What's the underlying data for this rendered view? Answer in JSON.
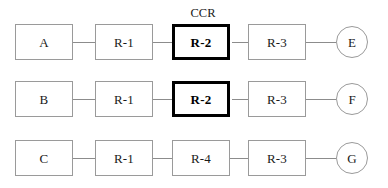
{
  "diagram": {
    "type": "process-flow",
    "title_annotation": {
      "label": "CCR",
      "x": 182,
      "y": 7,
      "width": 42,
      "describes": "row-1-stage-3"
    },
    "colors": {
      "background": "#ffffff",
      "node_border": "#9a9a9a",
      "highlight_border": "#000000",
      "connector": "#8c8c8c",
      "text": "#1a1a1a"
    },
    "geometry": {
      "box_width": 58,
      "box_height": 36,
      "circle_diameter": 32,
      "columns_x": [
        15,
        95,
        172,
        248
      ],
      "circle_x": 336,
      "rows_y": [
        24,
        81,
        140
      ]
    },
    "rows": [
      {
        "name": "row-1",
        "y": 24,
        "nodes": [
          {
            "id": "row-1-stage-1",
            "label": "A",
            "shape": "box",
            "x": 15,
            "highlight": false
          },
          {
            "id": "row-1-stage-2",
            "label": "R-1",
            "shape": "box",
            "x": 95,
            "highlight": false
          },
          {
            "id": "row-1-stage-3",
            "label": "R-2",
            "shape": "box",
            "x": 172,
            "highlight": true
          },
          {
            "id": "row-1-stage-4",
            "label": "R-3",
            "shape": "box",
            "x": 248,
            "highlight": false
          },
          {
            "id": "row-1-stage-5",
            "label": "E",
            "shape": "circle",
            "x": 336,
            "highlight": false
          }
        ],
        "connectors": [
          {
            "x": 73,
            "width": 22
          },
          {
            "x": 153,
            "width": 19
          },
          {
            "x": 232,
            "width": 16
          },
          {
            "x": 306,
            "width": 30
          }
        ]
      },
      {
        "name": "row-2",
        "y": 81,
        "nodes": [
          {
            "id": "row-2-stage-1",
            "label": "B",
            "shape": "box",
            "x": 15,
            "highlight": false
          },
          {
            "id": "row-2-stage-2",
            "label": "R-1",
            "shape": "box",
            "x": 95,
            "highlight": false
          },
          {
            "id": "row-2-stage-3",
            "label": "R-2",
            "shape": "box",
            "x": 172,
            "highlight": true
          },
          {
            "id": "row-2-stage-4",
            "label": "R-3",
            "shape": "box",
            "x": 248,
            "highlight": false
          },
          {
            "id": "row-2-stage-5",
            "label": "F",
            "shape": "circle",
            "x": 336,
            "highlight": false
          }
        ],
        "connectors": [
          {
            "x": 73,
            "width": 22
          },
          {
            "x": 153,
            "width": 19
          },
          {
            "x": 232,
            "width": 16
          },
          {
            "x": 306,
            "width": 30
          }
        ]
      },
      {
        "name": "row-3",
        "y": 140,
        "nodes": [
          {
            "id": "row-3-stage-1",
            "label": "C",
            "shape": "box",
            "x": 15,
            "highlight": false
          },
          {
            "id": "row-3-stage-2",
            "label": "R-1",
            "shape": "box",
            "x": 95,
            "highlight": false
          },
          {
            "id": "row-3-stage-3",
            "label": "R-4",
            "shape": "box",
            "x": 172,
            "highlight": false
          },
          {
            "id": "row-3-stage-4",
            "label": "R-3",
            "shape": "box",
            "x": 248,
            "highlight": false
          },
          {
            "id": "row-3-stage-5",
            "label": "G",
            "shape": "circle",
            "x": 336,
            "highlight": false
          }
        ],
        "connectors": [
          {
            "x": 73,
            "width": 22
          },
          {
            "x": 153,
            "width": 19
          },
          {
            "x": 230,
            "width": 18
          },
          {
            "x": 306,
            "width": 30
          }
        ]
      }
    ]
  }
}
